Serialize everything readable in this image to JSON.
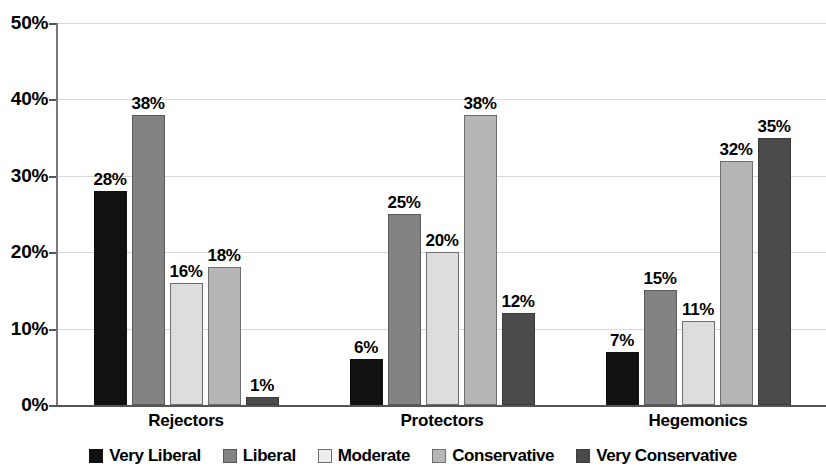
{
  "chart_data": {
    "type": "bar",
    "title": "",
    "subtitle": "",
    "xlabel": "",
    "ylabel": "",
    "ylim": [
      0,
      50
    ],
    "y_ticks": [
      "0%",
      "10%",
      "20%",
      "30%",
      "40%",
      "50%"
    ],
    "y_tick_values": [
      0,
      10,
      20,
      30,
      40,
      50
    ],
    "grid": true,
    "legend_position": "bottom",
    "value_suffix": "%",
    "categories": [
      "Rejectors",
      "Protectors",
      "Hegemonics"
    ],
    "series": [
      {
        "name": "Very Liberal",
        "color": "#111111",
        "border": "#111111",
        "values": [
          28,
          6,
          7
        ],
        "labels": [
          "28%",
          "6%",
          "7%"
        ]
      },
      {
        "name": "Liberal",
        "color": "#838383",
        "border": "#5a5a5a",
        "values": [
          38,
          25,
          15
        ],
        "labels": [
          "38%",
          "25%",
          "15%"
        ]
      },
      {
        "name": "Moderate",
        "color": "#dddddd",
        "border": "#6f6f6f",
        "values": [
          16,
          20,
          11
        ],
        "labels": [
          "16%",
          "20%",
          "11%"
        ]
      },
      {
        "name": "Conservative",
        "color": "#b6b6b6",
        "border": "#6f6f6f",
        "values": [
          18,
          38,
          32
        ],
        "labels": [
          "18%",
          "38%",
          "32%"
        ]
      },
      {
        "name": "Very Conservative",
        "color": "#4b4b4b",
        "border": "#3a3a3a",
        "values": [
          1,
          12,
          35
        ],
        "labels": [
          "1%",
          "12%",
          "35%"
        ]
      }
    ]
  },
  "legend": {
    "items": [
      {
        "label": "Very Liberal",
        "color": "#111111",
        "border": "#111111"
      },
      {
        "label": "Liberal",
        "color": "#838383",
        "border": "#5a5a5a"
      },
      {
        "label": "Moderate",
        "color": "#ededed",
        "border": "#6f6f6f"
      },
      {
        "label": "Conservative",
        "color": "#b6b6b6",
        "border": "#6f6f6f"
      },
      {
        "label": "Very Conservative",
        "color": "#4b4b4b",
        "border": "#3a3a3a"
      }
    ]
  }
}
